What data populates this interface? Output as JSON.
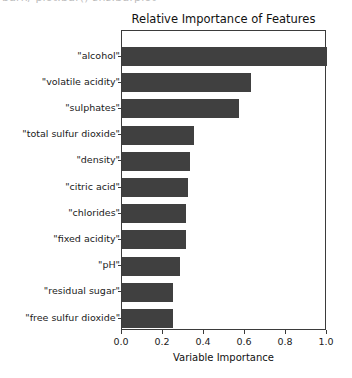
{
  "artifact": {
    "clipped_text": "barh/ plot.bar()   sns.barplot"
  },
  "chart_data": {
    "type": "bar",
    "orientation": "horizontal",
    "title": "Relative Importance of Features",
    "xlabel": "Variable Importance",
    "ylabel": "",
    "xlim": [
      0.0,
      1.0
    ],
    "xticks": [
      "0.0",
      "0.2",
      "0.4",
      "0.6",
      "0.8",
      "1.0"
    ],
    "xtick_values": [
      0.0,
      0.2,
      0.4,
      0.6,
      0.8,
      1.0
    ],
    "grid": false,
    "legend": null,
    "bar_color": "#404040",
    "categories": [
      "\"alcohol\"",
      "\"volatile acidity\"",
      "\"sulphates\"",
      "\"total sulfur dioxide\"",
      "\"density\"",
      "\"citric acid\"",
      "\"chlorides\"",
      "\"fixed acidity\"",
      "\"pH\"",
      "\"residual sugar\"",
      "\"free sulfur dioxide\""
    ],
    "values": [
      1.0,
      0.63,
      0.57,
      0.35,
      0.33,
      0.32,
      0.31,
      0.31,
      0.285,
      0.25,
      0.25
    ]
  }
}
